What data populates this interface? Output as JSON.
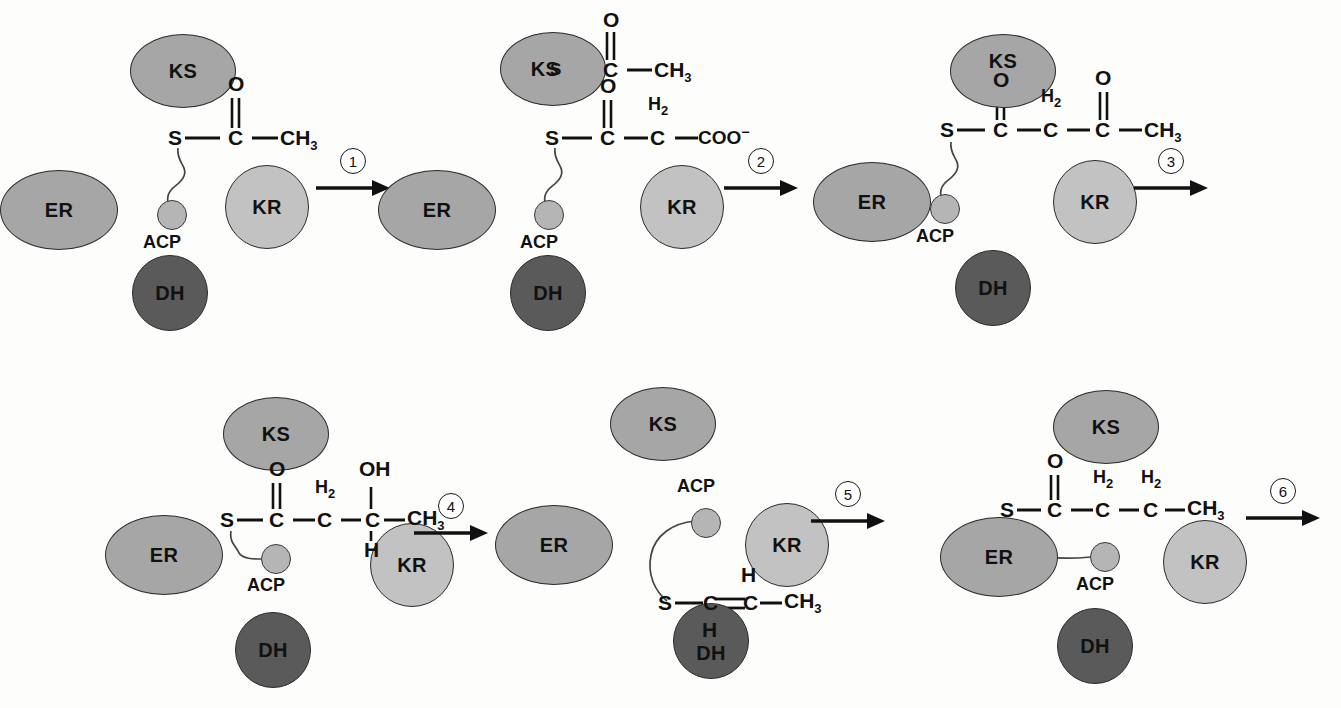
{
  "figure": {
    "enzyme_labels": {
      "ks": "KS",
      "er": "ER",
      "kr": "KR",
      "dh": "DH",
      "acp": "ACP"
    },
    "colors": {
      "ks_fill": "#a6a6a6",
      "er_fill": "#a6a6a6",
      "kr_fill": "#c2c2c2",
      "dh_fill": "#5a5a5a",
      "acp_fill": "#b5b5b5",
      "outline": "#2b2b2b",
      "text": "#111111",
      "background": "#fdfdfb"
    },
    "atoms": {
      "S": "S",
      "C": "C",
      "O": "O",
      "H": "H",
      "OH": "OH",
      "CH3_main": "CH",
      "CH3_sub": "3",
      "H2_main": "H",
      "H2_sub": "2",
      "COO_main": "COO",
      "COO_sup": "−"
    },
    "steps": [
      {
        "number": "1",
        "panel": "acetyl-ACP"
      },
      {
        "number": "2",
        "panel": "acetyl-KS + malonyl-ACP"
      },
      {
        "number": "3",
        "panel": "acetoacetyl-ACP"
      },
      {
        "number": "4",
        "panel": "beta-hydroxybutyryl-ACP"
      },
      {
        "number": "5",
        "panel": "crotonyl-ACP"
      },
      {
        "number": "6",
        "panel": "butyryl-ACP"
      }
    ],
    "panels": [
      {
        "id": "panel-1",
        "name": "acetyl-ACP",
        "chain": "S-C(=O)-CH3",
        "labels": {
          "s": "S",
          "c1": "C",
          "o1": "O",
          "terminal": "CH"
        }
      },
      {
        "id": "panel-2",
        "name": "acetyl-KS-and-malonyl-ACP",
        "ks_chain": "KS-S-C(=O)-CH3",
        "acp_chain": "S-C(=O)-CH2-COO-"
      },
      {
        "id": "panel-3",
        "name": "acetoacetyl-ACP",
        "chain": "S-C(=O)-CH2-C(=O)-CH3"
      },
      {
        "id": "panel-4",
        "name": "beta-hydroxybutyryl-ACP",
        "chain": "S-C(=O)-CH2-CH(OH)-CH3"
      },
      {
        "id": "panel-5",
        "name": "crotonyl-ACP",
        "chain": "S-C(H)=C(H)-CH3"
      },
      {
        "id": "panel-6",
        "name": "butyryl-ACP",
        "chain": "S-C(=O)-CH2-CH2-CH3"
      }
    ]
  }
}
